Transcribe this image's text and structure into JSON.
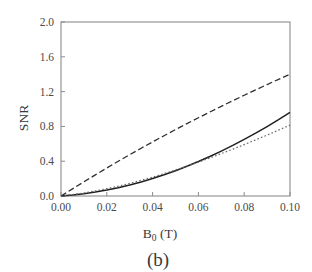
{
  "figure": {
    "panel_label": "(b)",
    "background_color": "#ffffff",
    "frame_color": "#8c8c8c",
    "text_color": "#3a3a3a"
  },
  "chart_data": {
    "type": "line",
    "title": "",
    "subtitle": "",
    "xlabel": "B_0 (T)",
    "xlabel_base": "B",
    "xlabel_subscript": "0",
    "xlabel_unit": " (T)",
    "ylabel": "SNR",
    "xlim": [
      0.0,
      0.1
    ],
    "ylim": [
      0.0,
      2.0
    ],
    "xticks": [
      0.0,
      0.02,
      0.04,
      0.06,
      0.08,
      0.1
    ],
    "xtick_labels": [
      "0.00",
      "0.02",
      "0.04",
      "0.06",
      "0.08",
      "0.10"
    ],
    "yticks": [
      0.0,
      0.4,
      0.8,
      1.2,
      1.6,
      2.0
    ],
    "ytick_labels": [
      "0.0",
      "0.4",
      "0.8",
      "1.2",
      "1.6",
      "2.0"
    ],
    "grid": false,
    "legend": false,
    "legend_position": "none",
    "x": [
      0.0,
      0.005,
      0.01,
      0.015,
      0.02,
      0.025,
      0.03,
      0.035,
      0.04,
      0.045,
      0.05,
      0.055,
      0.06,
      0.065,
      0.07,
      0.075,
      0.08,
      0.085,
      0.09,
      0.095,
      0.1
    ],
    "series": [
      {
        "name": "dashed-upper",
        "style": "dashed",
        "color": "#303030",
        "dash_pattern": "6,3",
        "width": 1.3,
        "values": [
          0.0,
          0.082,
          0.163,
          0.243,
          0.322,
          0.399,
          0.475,
          0.549,
          0.622,
          0.693,
          0.763,
          0.832,
          0.899,
          0.966,
          1.031,
          1.095,
          1.158,
          1.22,
          1.281,
          1.341,
          1.4
        ]
      },
      {
        "name": "solid-middle",
        "style": "solid",
        "color": "#202020",
        "dash_pattern": "none",
        "width": 1.5,
        "values": [
          0.0,
          0.012,
          0.027,
          0.046,
          0.069,
          0.096,
          0.127,
          0.162,
          0.201,
          0.244,
          0.291,
          0.342,
          0.396,
          0.454,
          0.516,
          0.581,
          0.65,
          0.722,
          0.798,
          0.877,
          0.96
        ]
      },
      {
        "name": "dotted-lower",
        "style": "dotted",
        "color": "#6a6a6a",
        "dash_pattern": "1.6,2.2",
        "width": 1.2,
        "values": [
          0.0,
          0.016,
          0.035,
          0.058,
          0.084,
          0.113,
          0.145,
          0.18,
          0.217,
          0.257,
          0.299,
          0.343,
          0.389,
          0.437,
          0.487,
          0.538,
          0.591,
          0.645,
          0.7,
          0.757,
          0.815
        ]
      }
    ],
    "series_endpoints": {
      "dashed-upper": 1.55,
      "solid-middle": 1.23,
      "dotted-lower": 0.96
    }
  }
}
